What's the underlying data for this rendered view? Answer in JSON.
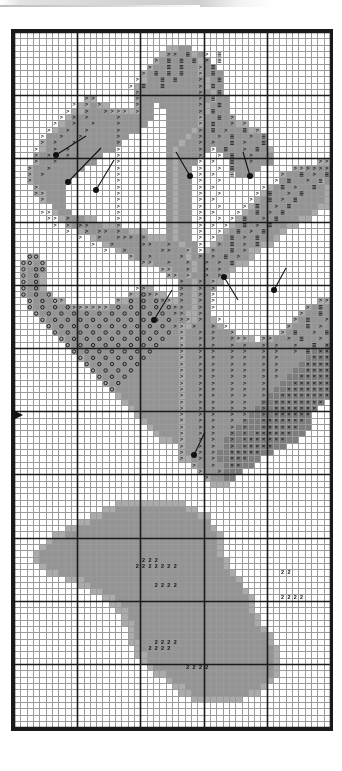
{
  "document": {
    "kind": "cross-stitch-pattern-chart",
    "title": "Cross Stitch Pattern Chart",
    "description": "Black and white counted cross stitch chart of a flower with leaves, drawn as a symbol grid."
  },
  "grid": {
    "columns": 50,
    "rows": 110,
    "cell_size_px": 6.32,
    "origin_x_px": 3,
    "origin_y_px": 3,
    "bold_line_every": 10,
    "line_color": "#9a9a9a",
    "bold_line_color": "#1a1a1a",
    "border_color": "#1a1a1a",
    "background": "#ffffff"
  },
  "legend": {
    "palette": [
      {
        "key": "blank",
        "label": "unstitched",
        "color": "#ffffff",
        "symbol": ""
      },
      {
        "key": "l1",
        "label": "very light",
        "color": "#e0e0e0",
        "symbol": ""
      },
      {
        "key": "l2",
        "label": "light",
        "color": "#c8c8c8",
        "symbol": ""
      },
      {
        "key": "m1",
        "label": "medium",
        "color": "#ababab",
        "symbol": ""
      },
      {
        "key": "m2",
        "label": "medium dark",
        "color": "#949494",
        "symbol": ""
      },
      {
        "key": "d1",
        "label": "dark",
        "color": "#7c7c7c",
        "symbol": ""
      },
      {
        "key": "d2",
        "label": "very dark",
        "color": "#5e5e5e",
        "symbol": ""
      }
    ],
    "symbols": [
      {
        "key": "gt",
        "glyph": ">",
        "name": "greater-than-symbol"
      },
      {
        "key": "bars",
        "glyph": "≡",
        "name": "triple-bar-symbol"
      },
      {
        "key": "circle",
        "glyph": "○",
        "name": "circle-symbol"
      },
      {
        "key": "two",
        "glyph": "2",
        "name": "digit-two-symbol"
      },
      {
        "key": "cross",
        "glyph": "×",
        "name": "cross-symbol"
      }
    ],
    "markers": {
      "french_knot": {
        "name": "french-knot-marker",
        "color": "#111111"
      },
      "center_arrow": {
        "name": "center-arrow-marker",
        "glyph": "▶",
        "color": "#111111"
      }
    }
  },
  "chart_data": {
    "type": "heatmap",
    "xlabel": "",
    "ylabel": "",
    "columns": 50,
    "rows": 110,
    "value_keys": [
      "blank",
      "l1",
      "l2",
      "m1",
      "m2",
      "d1",
      "d2"
    ],
    "note": "Each row string has 50 characters. '.'=blank, 'a'=l1, 'b'=l2, 'c'=m1, 'd'=m2, 'e'=d1, 'f'=d2.",
    "fill_rows": [
      "..................................................",
      "..................................................",
      "........................ccdd......................",
      ".......................cddddcd....................",
      "......................cddddddcd...................",
      ".....................cdddddddcdd..................",
      "....................cddddddddcddd.................",
      "....................cdddddddddcdd.................",
      "...................cddddddddddcdd.................",
      "...................cdddddddddddcd.................",
      "...........cc......cdddddddddddcdd................",
      "..........ccdcc....cdd.dddddddcddd................",
      ".........ccddddcccccdd..ddddddcddd................",
      "........cddddddddddddd..dddddcddddc...............",
      ".......cddddddddddddd...dddddcdddddcc.............",
      "......cddddddddddddd....ddddcddddddddcc...........",
      ".....ddddddddddddd......dddcdddddddddddc..........",
      "....cdddddddddddd.......ddcddddddddddddd..........",
      "....cddddddddddd........dcddddd.ddddddddc.........",
      "...cdddddddddd..........dcdddd...dddddddd.........",
      "...cddddddddd...........dcddd.....ddddddd.......cc",
      "..cdddddddd.............dcdd......ddddd.....ccdddd",
      "..cddddddd..............dcdd.......ddd....cddddddd",
      "..cdddddd...............dcdd..............ddddddcd",
      "...cdddd................dcdd............cddddddddc",
      "...ccddd................dcdd...........cdddddddddc",
      "....cddd................dcdd..........cddddddddddc",
      "......dd................dcdd.........cddddddddddcc",
      "......cdd...............dcdd........cddddddddddc..",
      ".......cdddcc...........dcdd.......cdddddddddcc...",
      "........cdddddccc.......dcdd......cddddddddcc.....",
      "..........cdddddddccc...dcdd.....cddddddddc.......",
      "............cddddddddcccdcdd....cddddddddc........",
      "..............cdddddddddddcdd..cdddddddcc.........",
      "................cddddddddddcd.cddddddcc...........",
      "..cc..............cddddddddcdddddddddc............",
      ".ccdc...............ccddddddcddddddcc.............",
      ".cddd..................ccdddcdddddc...............",
      ".cddc...................ccdcdddddc................",
      ".cddc.....................ddcddcc.................",
      ".cddc...............cc....ddcddc..................",
      ".cdddc............ccddcc..ddcdd...................",
      "..cdddcc........ccddddddccddcdd.................cc",
      "..cddddddccccccdddddddddddddcdd...............cddd",
      "...cdddddddddddddddddddddddccdd..............cdddd",
      "....cddddddddddddddddddddddccddc............cddddd",
      ".....cddddddddddddddddddddccddddc..........cdddddd",
      "......cdddddddddddddddddddcdddddddc.......cddddddd",
      ".......cddddddddddddddddddcddddddddccc.ccddddddddd",
      "........cdddddddddddddddddcdddddddddddddddddddddde",
      ".........cddddddddddddddddcddddddddddddddddddddeee",
      "..........cdddddddddddddddcdddddddddddddddddddeeee",
      "...........cddddddddddddddcddddddddddddddddddeeeee",
      "............cdddddddddddddcdddddddddddddddddeeeeee",
      ".............cddddddddddddcddddddddddddddddeeeeeee",
      "..............cdddddddddddcdddddddddddddddeeeeeeee",
      "...............cddddddddddcddddddddddddddeeeeeeeee",
      "................cdddddddddcdddddddddddddeeeeeeeeee",
      ".................cddddddddcddddddddddddeeeeeeeeee.",
      "..................cdddddddcdddddddddddeeeeeeeeee..",
      "...................cddddddcddddddddddeeeeeeeeee...",
      "....................cdddddcdddddddddeeeeeeeeeee...",
      ".....................cddddcddddddddeeeeeeeeeeee...",
      "......................cdddcdddddddeeeeeeeeeeee....",
      ".......................ccdcddddddeeeeeeeeeeee.....",
      "..........................cddddddeeeeeeeeee.......",
      "..........................cdddddeeeeeeeee.........",
      "..........................ccddddeeeeeee...........",
      "............................cddddeeeee............",
      ".............................cdddeee..............",
      "..............................cddee...............",
      "...............................ccc................",
      "..................................................",
      "..................................................",
      "................ccccccccccc.......................",
      "..............ccdddddddddddcc.....................",
      "............ccdddddddddddddddcc...................",
      "..........ccddddddddddddddddddd...................",
      "........ccdddddddddddddddddddddc..................",
      "......ccddddddddddddddddddddddddc.................",
      ".....cddddddddddddddddddddddddddc.................",
      "....cdddddddddddddddddddddddddddc.................",
      "...cddddddddddddddddddddddddddddc.................",
      "...cdddddddddddddddddddddddddddddc................",
      "....cddddddddddddddddddddddddddddc................",
      ".....ccdddddddddddddddddddddddddddc...............",
      "........cccddddddddddddddddddddddddc..............",
      "..........ccdddddddddddddddddddddddd..............",
      "............ccddddddddddddddddddddddc.............",
      "..............ccdddddddddddddddddddddc............",
      "...............ccddddddddddddddddddddc............",
      "................ccdddddddddddddddddddc............",
      ".................cddddddddddddddddddddc...........",
      ".................ccdddddddddddddddddddc...........",
      "..................cddddddddddddddddddddc..........",
      "..................cdddddddddddddddddddddc.........",
      "..................ccddddddddddddddddddddc.........",
      "...................cdddddddddddddddddddddc........",
      "...................ccddddddddddddddddddddc........",
      "....................cddddddddddddddddddddc........",
      ".....................cdddddddddddddddddddc........",
      "......................ccdddddddddddddddddc........",
      "........................cdddddddddddddddc.........",
      ".........................ccddddddddddddc..........",
      "..........................ccdddddddddcc...........",
      "............................cccccccc..............",
      "..................................................",
      "..................................................",
      "..................................................",
      "..................................................",
      ".................................................."
    ],
    "symbol_rows": [
      "..................................................",
      "..................................................",
      "..................................................",
      "........................>>.=..>.=..................",
      "......................>.=.=.=.>.=.................",
      ".....................>..=.=..>.=..................",
      "....................>.=.=.=..>.=..................",
      "...................>...=.=...>..=.................",
      "..................>.=..=.....>.=..................",
      "...................>.........>..=.................",
      "...........>>......>.........>.=..................",
      ".........>.>.>.....>.........>..=.................",
      "........>..>..>>>>.>.........>.=..................",
      ".......>.>.>....>............>..=.>...............",
      "......>..>..>...>............>.=..>.>.............",
      ".....>..>..>....>............>.=.>..=.>...........",
      "....>..>..>.....>............>..>.=..>.=..........",
      "....>.>..>......>............>.>..=.>..=..........",
      "...>..>.>.......>............>.>.=..>.=...........",
      "...>.>..>.......>............>..>.=..>............",
      "...>..>.........>............>.>..=..>..........>>",
      "..>..>..........>............>..>.=.........>>>>>>",
      "..>.>...........>............>.>..=.......>..=.>.=",
      "..>.............>............>..>........>.=..>.=.",
      "...>............>............>.>.......>..=.>..=..",
      "...>>...........>............>..>.....>.=..>.=....",
      "....>...........>............>.>.....>..=.>.=.....",
      "................>............>..>...>.=..>.=......",
      "....>>..........>............>.>...>..=.>.=.......",
      ".....>>.>.......>............>..>.>.=..>.=........",
      "......>.>.>>....>............>.>.>..=.>.=.........",
      "........>..>.>>.>............>..>..=.>.=..........",
      "..........>..>..>>>.>........>.>..=.>.=...........",
      "............>..>....>>..>....>..>.=.>.=...........",
      "..............>..>.....>>..>.>.>..=.>.............",
      "..oo..............>..>....>..>.>.=.>..............",
      ".oo.o...............>>..>..>..>.>.=...............",
      ".o.oo..................>>..>..>.>.................",
      ".o.o....................>>.>..>.>.................",
      ".o.o......................>..>.>..................",
      ".o.o...............>>.....>..>.>..................",
      ".o.o.o............>.o>>...>..>.>..................",
      "..o.o.o>........>.o.o.o>>.>..>.>................>>",
      "..o.o.o.o>>>>>>.o.o.o.o.o>>..>.>..............>.=.",
      "...o.o.o.o.o.o.o.o.o.o.o.>>..>...............>..=.",
      "....o.o.o.o.o.o.o.o.o.o.o.>>.>..>...........>.=..>",
      ".....o.o.o.o.o.o.o.o.o.o.>>.>..>.>.........>..=.>.",
      "......o.o.o.o.o.o.o.o.o.o.>..>.>..>.......>.=..>.=",
      ".......o.o.o.o.o.o.o.o.o..>..>.>..>>>..>>..>.=..>.",
      "........o.o.o.o.o.o.o.o...>..>.>..>.>..>.>..>..=.x",
      ".........o.o.o.o.o.o.o....>..>.>..>.>..>.>..>.=.xx",
      "..........o.o.o.o.o.o.....>..>.>..>.>..>.>.....xxx",
      "...........o.o.o.o.o......>..>.>..>.>..>.>....xxxx",
      "............o.o.o.o.......>..>.>..>.>..>.>....xxxx",
      ".............o.o.o........>..>.>..>.>..>.>...xxxxx",
      "..............o.o.........>..>.>..>.>..>....xxxxxx",
      "...............o..........>..>.>..>.>..>...xxxxxxx",
      "..........................>..>.>..>.>..>..xxxxxxxx",
      "..........................>..>.>..>.>..>.xxxxxxxx.",
      "..........................>..>.>..>.>..>.xxxxxxx..",
      "..........................>..>.>..>.>..>.xxxxxx...",
      "..........................>..>.>..>.>..xxxxxxx....",
      "..........................>..>.>..>.>..xxxxxx.....",
      "..........................>..>.>..>.>.xxxxxx......",
      "..........................>..>.>..>.xxxxxxx.......",
      "..........................>..>.>..>.xxxxx.........",
      "..........................>..>.>..xxxxx...........",
      "..........................>..>.>..xxx.............",
      "............................>..>..xx..............",
      ".............................>..>.................",
      "..............................>...................",
      "..................................................",
      "..................................................",
      "..................................................",
      "..................................................",
      "..................................................",
      "..................................................",
      "..................................................",
      "..................................................",
      "..................................................",
      "..................................................",
      "..................................................",
      "..................................................",
      "....................222...........................",
      "...................2222222........................",
      "..........................................22......",
      "..................................................",
      "......................2222........................",
      "..................................................",
      "..........................................2222....",
      "..................................................",
      "..................................................",
      "..................................................",
      "..................................................",
      "..................................................",
      "..................................................",
      "......................2222........................",
      ".....................2222.........................",
      "..................................................",
      "..................................................",
      "...........................2222...................",
      "..................................................",
      "..................................................",
      "..................................................",
      "..................................................",
      "..................................................",
      "..................................................",
      "..................................................",
      "..................................................",
      "..................................................",
      ".................................................."
    ],
    "french_knots": [
      {
        "dot_x": 56,
        "dot_y": 155,
        "tip_x": 86,
        "tip_y": 136
      },
      {
        "dot_x": 68,
        "dot_y": 182,
        "tip_x": 101,
        "tip_y": 148
      },
      {
        "dot_x": 96,
        "dot_y": 190,
        "tip_x": 114,
        "tip_y": 160
      },
      {
        "dot_x": 190,
        "dot_y": 176,
        "tip_x": 176,
        "tip_y": 152
      },
      {
        "dot_x": 250,
        "dot_y": 176,
        "tip_x": 243,
        "tip_y": 152
      },
      {
        "dot_x": 154,
        "dot_y": 320,
        "tip_x": 172,
        "tip_y": 290
      },
      {
        "dot_x": 224,
        "dot_y": 277,
        "tip_x": 238,
        "tip_y": 300
      },
      {
        "dot_x": 274,
        "dot_y": 290,
        "tip_x": 286,
        "tip_y": 268
      },
      {
        "dot_x": 194,
        "dot_y": 455,
        "tip_x": 205,
        "tip_y": 432
      }
    ],
    "center_markers": [
      {
        "edge": "left",
        "y_px": 386,
        "glyph": "▶"
      }
    ]
  }
}
